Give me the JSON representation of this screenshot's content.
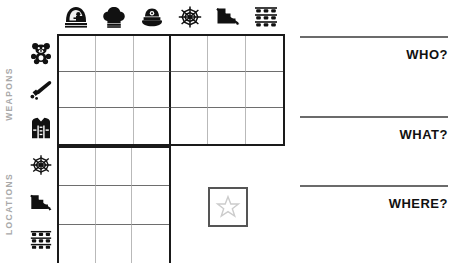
{
  "sheet": {
    "title": "Mystery Deduction Grid",
    "sections": [
      {
        "id": "weapons",
        "label": "WEAPONS"
      },
      {
        "id": "locations",
        "label": "LOCATIONS"
      }
    ],
    "label_color": "#a9a9a9",
    "grid_line_color": "#1a1a1a",
    "inner_line_color": "#6e6e6e"
  },
  "column_icons": [
    {
      "name": "knight-helmet-icon",
      "label": "Knight Helmet"
    },
    {
      "name": "chef-hat-icon",
      "label": "Chef Hat"
    },
    {
      "name": "police-cap-icon",
      "label": "Police Cap"
    },
    {
      "name": "spider-web-icon",
      "label": "Spider Web"
    },
    {
      "name": "staircase-icon",
      "label": "Staircase"
    },
    {
      "name": "bunk-beds-icon",
      "label": "Bunk Beds"
    }
  ],
  "row_icons": [
    {
      "name": "teddy-bear-icon",
      "label": "Teddy Bear",
      "group": "weapons"
    },
    {
      "name": "baseball-bat-icon",
      "label": "Baseball Bat",
      "group": "weapons"
    },
    {
      "name": "jacket-icon",
      "label": "Jacket",
      "group": "weapons"
    },
    {
      "name": "spider-web-icon",
      "label": "Spider Web",
      "group": "locations"
    },
    {
      "name": "staircase-icon",
      "label": "Staircase",
      "group": "locations"
    },
    {
      "name": "bunk-beds-icon",
      "label": "Bunk Beds",
      "group": "locations"
    }
  ],
  "grids": {
    "top": {
      "columns": 6,
      "rows": 3,
      "divider_after_column": 3,
      "cells": []
    },
    "bottom": {
      "columns": 3,
      "rows": 3,
      "cells": []
    }
  },
  "star_box": {
    "name": "star-box",
    "icon": "star-icon",
    "value": "",
    "border_color": "#555555",
    "star_color": "#cccccc"
  },
  "answers": [
    {
      "id": "who",
      "label": "WHO?",
      "value": ""
    },
    {
      "id": "what",
      "label": "WHAT?",
      "value": ""
    },
    {
      "id": "where",
      "label": "WHERE?",
      "value": ""
    }
  ]
}
